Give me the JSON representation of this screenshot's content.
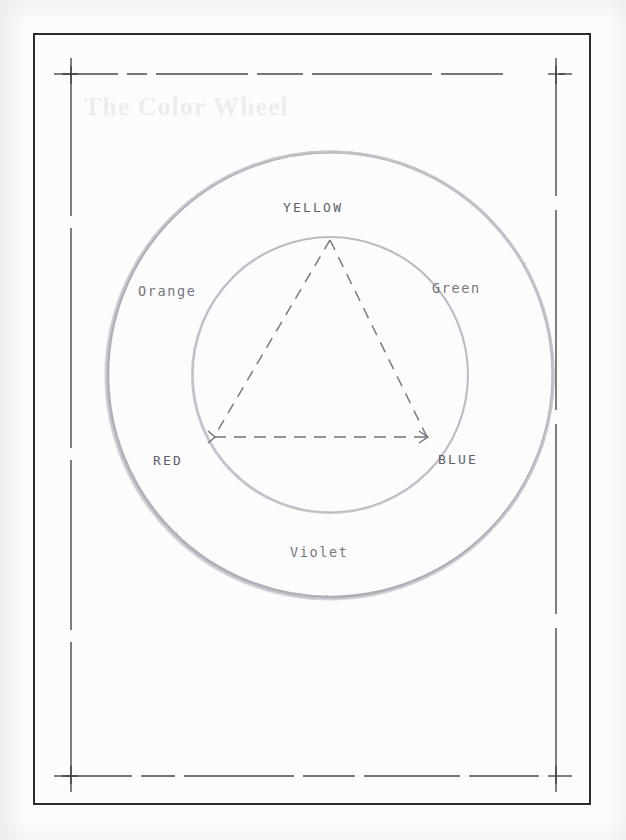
{
  "page": {
    "title": "The Color Wheel",
    "medium": "scanned pencil diagram on paper",
    "background_color": "#fcfcfc",
    "ink_color": "#2b2b2b"
  },
  "frame": {
    "outer_border_label": "page-border",
    "dashed_guide_label": "crop-guide-rectangle"
  },
  "diagram": {
    "name": "color-wheel",
    "outer_circle": {
      "label": "outer-circle",
      "cx": 330,
      "cy": 375,
      "r": 223
    },
    "inner_circle": {
      "label": "inner-circle",
      "cx": 330,
      "cy": 375,
      "r": 138
    },
    "triangle": {
      "label": "primary-color-triangle",
      "style": "dashed",
      "vertices": [
        {
          "name": "yellow-vertex",
          "x": 330,
          "y": 240
        },
        {
          "name": "red-vertex",
          "x": 214,
          "y": 437
        },
        {
          "name": "blue-vertex",
          "x": 427,
          "y": 437
        }
      ]
    }
  },
  "labels": {
    "yellow": "YELLOW",
    "orange": "Orange",
    "green": "Green",
    "red": "RED",
    "blue": "BLUE",
    "violet": "Violet"
  },
  "colors": {
    "pencil_light": "#c9c9cf",
    "pencil_mid": "#a9a9b1",
    "text_gray": "#6d6d72",
    "frame_ink": "#2b2b2b",
    "dash_ink": "#4a4a4a"
  }
}
